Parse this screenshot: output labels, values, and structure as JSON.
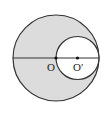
{
  "diagram": {
    "type": "geometry",
    "colors": {
      "shade": "#dcdcdc",
      "stroke": "#333333",
      "background": "#ffffff"
    },
    "large_circle": {
      "cx": 56,
      "cy": 58,
      "r": 43
    },
    "small_circle": {
      "cx": 77.5,
      "cy": 58,
      "r": 21.5
    },
    "diameter": {
      "x1": 13,
      "y1": 58,
      "x2": 99,
      "y2": 58
    },
    "points": [
      {
        "id": "O",
        "label": "O",
        "x": 56,
        "y": 58,
        "label_x": 47,
        "label_y": 71
      },
      {
        "id": "O_prime",
        "label": "O′",
        "x": 77.5,
        "y": 58,
        "label_x": 73,
        "label_y": 71
      }
    ]
  }
}
